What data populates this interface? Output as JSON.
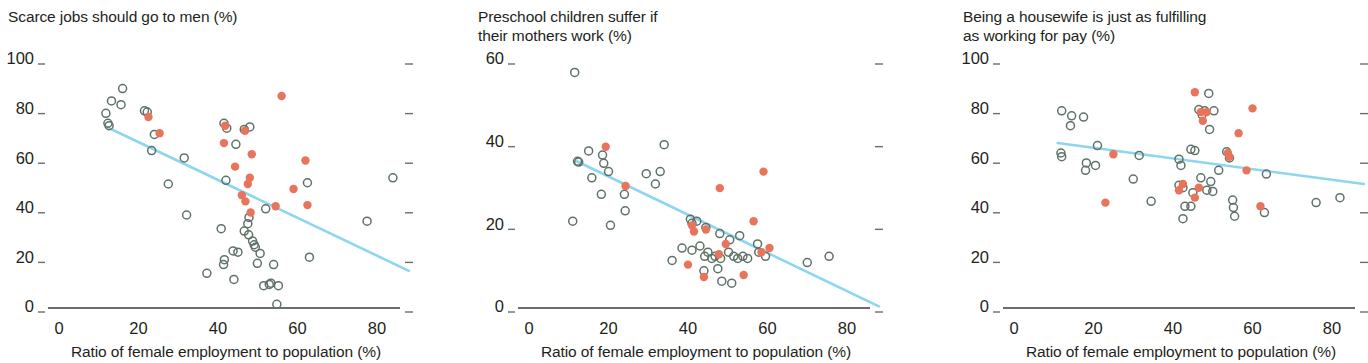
{
  "figure": {
    "width": 1368,
    "height": 363,
    "background": "#ffffff",
    "open_point_color": "#5f7268",
    "filled_point_color": "#e8745b",
    "trend_line_color": "#8ed5ef",
    "axis_color": "#3b3b3b",
    "text_color": "#231f20"
  },
  "chart_data": [
    {
      "type": "scatter",
      "panel_index": 0,
      "title": "Scarce jobs should go to men (%)",
      "title_lines": [
        "Scarce jobs should go to men (%)"
      ],
      "xlabel": "Ratio of female employment to population (%)",
      "ylabel": "Scarce jobs should go to men (%)",
      "xlim": [
        0,
        90
      ],
      "ylim": [
        0,
        100
      ],
      "xticks": [
        0,
        20,
        40,
        60,
        80
      ],
      "yticks": [
        0,
        20,
        40,
        60,
        80,
        100
      ],
      "xticklabels": [
        "0",
        "20",
        "40",
        "60",
        "80"
      ],
      "yticklabels": [
        "0",
        "20",
        "40",
        "60",
        "80",
        "100"
      ],
      "grid": false,
      "legend": "none",
      "right_ticks": true,
      "trend": {
        "x0": 12.0,
        "y0": 73.0,
        "x1": 88.0,
        "y1": 15.0
      },
      "series": [
        {
          "name": "open",
          "marker": "open-circle",
          "color": "#5f7268",
          "points": [
            [
              16.0,
              88.5
            ],
            [
              13.2,
              83.5
            ],
            [
              15.6,
              82.0
            ],
            [
              11.8,
              78.5
            ],
            [
              21.5,
              79.5
            ],
            [
              22.2,
              79.0
            ],
            [
              12.3,
              74.5
            ],
            [
              12.6,
              73.5
            ],
            [
              24.0,
              70.0
            ],
            [
              23.3,
              63.5
            ],
            [
              31.5,
              60.5
            ],
            [
              41.5,
              74.5
            ],
            [
              42.2,
              72.5
            ],
            [
              46.6,
              72.0
            ],
            [
              48.0,
              73.0
            ],
            [
              44.5,
              66.0
            ],
            [
              42.0,
              51.5
            ],
            [
              62.5,
              50.5
            ],
            [
              84.0,
              52.5
            ],
            [
              27.5,
              50.0
            ],
            [
              32.1,
              37.5
            ],
            [
              52.0,
              40.0
            ],
            [
              47.8,
              36.5
            ],
            [
              47.5,
              34.0
            ],
            [
              40.8,
              32.0
            ],
            [
              46.6,
              31.0
            ],
            [
              47.7,
              29.5
            ],
            [
              48.7,
              27.0
            ],
            [
              49.1,
              25.5
            ],
            [
              49.4,
              24.5
            ],
            [
              43.8,
              23.0
            ],
            [
              45.0,
              22.5
            ],
            [
              50.6,
              22.0
            ],
            [
              63.0,
              20.5
            ],
            [
              77.5,
              35.0
            ],
            [
              41.6,
              19.5
            ],
            [
              41.4,
              17.5
            ],
            [
              49.9,
              18.0
            ],
            [
              54.0,
              17.5
            ],
            [
              37.2,
              14.0
            ],
            [
              44.0,
              11.5
            ],
            [
              51.5,
              9.0
            ],
            [
              52.9,
              9.5
            ],
            [
              53.3,
              10.0
            ],
            [
              55.2,
              9.0
            ],
            [
              54.8,
              1.5
            ]
          ]
        },
        {
          "name": "filled",
          "marker": "filled-circle",
          "color": "#e8745b",
          "points": [
            [
              56.0,
              85.5
            ],
            [
              22.5,
              77.0
            ],
            [
              25.3,
              70.5
            ],
            [
              41.8,
              73.5
            ],
            [
              46.8,
              71.5
            ],
            [
              41.5,
              66.5
            ],
            [
              48.5,
              62.0
            ],
            [
              62.0,
              59.5
            ],
            [
              44.3,
              57.0
            ],
            [
              48.0,
              52.5
            ],
            [
              47.5,
              50.0
            ],
            [
              46.0,
              45.5
            ],
            [
              59.0,
              48.0
            ],
            [
              48.2,
              38.5
            ],
            [
              54.5,
              41.0
            ],
            [
              62.5,
              41.5
            ],
            [
              46.9,
              43.0
            ]
          ]
        }
      ]
    },
    {
      "type": "scatter",
      "panel_index": 1,
      "title": "Preschool children suffer if their mothers work (%)",
      "title_lines": [
        "Preschool children suffer if",
        "their mothers work (%)"
      ],
      "xlabel": "Ratio of female employment to population (%)",
      "ylabel": "Preschool children suffer if their mothers work (%)",
      "xlim": [
        0,
        90
      ],
      "ylim": [
        0,
        60
      ],
      "xticks": [
        0,
        20,
        40,
        60,
        80
      ],
      "yticks": [
        0,
        20,
        40,
        60
      ],
      "xticklabels": [
        "0",
        "20",
        "40",
        "60",
        "80"
      ],
      "yticklabels": [
        "0",
        "20",
        "40",
        "60"
      ],
      "grid": false,
      "legend": "none",
      "right_ticks": true,
      "trend": {
        "x0": 12.0,
        "y0": 35.5,
        "x1": 88.0,
        "y1": 0.4
      },
      "series": [
        {
          "name": "open",
          "marker": "open-circle",
          "color": "#5f7268",
          "points": [
            [
              11.5,
              57.0
            ],
            [
              15.0,
              38.0
            ],
            [
              18.5,
              37.0
            ],
            [
              18.8,
              35.0
            ],
            [
              12.2,
              35.5
            ],
            [
              12.5,
              35.3
            ],
            [
              20.0,
              33.0
            ],
            [
              15.8,
              31.5
            ],
            [
              18.2,
              27.5
            ],
            [
              24.0,
              27.5
            ],
            [
              24.2,
              23.5
            ],
            [
              11.0,
              21.0
            ],
            [
              20.5,
              20.0
            ],
            [
              34.0,
              39.5
            ],
            [
              29.5,
              32.5
            ],
            [
              31.8,
              30.0
            ],
            [
              33.0,
              33.0
            ],
            [
              40.6,
              21.5
            ],
            [
              42.2,
              21.0
            ],
            [
              41.0,
              20.5
            ],
            [
              44.5,
              19.5
            ],
            [
              48.0,
              18.0
            ],
            [
              50.5,
              16.5
            ],
            [
              53.0,
              17.5
            ],
            [
              57.5,
              15.5
            ],
            [
              57.8,
              13.5
            ],
            [
              38.5,
              14.5
            ],
            [
              41.0,
              14.0
            ],
            [
              43.0,
              15.0
            ],
            [
              45.0,
              13.5
            ],
            [
              44.2,
              12.5
            ],
            [
              46.0,
              12.0
            ],
            [
              46.8,
              12.5
            ],
            [
              48.2,
              12.0
            ],
            [
              50.2,
              13.5
            ],
            [
              51.5,
              12.5
            ],
            [
              52.5,
              12.0
            ],
            [
              53.8,
              12.5
            ],
            [
              55.0,
              12.0
            ],
            [
              36.0,
              11.5
            ],
            [
              44.0,
              9.0
            ],
            [
              47.5,
              9.5
            ],
            [
              48.5,
              6.5
            ],
            [
              51.0,
              6.0
            ],
            [
              59.5,
              12.5
            ],
            [
              70.0,
              11.0
            ],
            [
              75.5,
              12.5
            ]
          ]
        },
        {
          "name": "filled",
          "marker": "filled-circle",
          "color": "#e8745b",
          "points": [
            [
              19.3,
              39.0
            ],
            [
              24.3,
              29.5
            ],
            [
              48.0,
              29.0
            ],
            [
              59.0,
              33.0
            ],
            [
              41.0,
              20.0
            ],
            [
              41.5,
              18.5
            ],
            [
              44.5,
              19.0
            ],
            [
              56.5,
              21.0
            ],
            [
              49.5,
              15.5
            ],
            [
              47.8,
              13.0
            ],
            [
              58.5,
              13.5
            ],
            [
              60.5,
              14.5
            ],
            [
              40.0,
              10.5
            ],
            [
              44.0,
              7.5
            ],
            [
              54.0,
              8.0
            ]
          ]
        }
      ]
    },
    {
      "type": "scatter",
      "panel_index": 2,
      "title": "Being a housewife is just as fulfilling as working for pay (%)",
      "title_lines": [
        "Being a housewife is just as fulfilling",
        "as working for pay (%)"
      ],
      "xlabel": "Ratio of female employment to population (%)",
      "ylabel": "Being a housewife is just as fulfilling as working for pay (%)",
      "xlim": [
        0,
        90
      ],
      "ylim": [
        0,
        100
      ],
      "xticks": [
        0,
        20,
        40,
        60,
        80
      ],
      "yticks": [
        0,
        20,
        40,
        60,
        80,
        100
      ],
      "xticklabels": [
        "0",
        "20",
        "40",
        "60",
        "80"
      ],
      "yticklabels": [
        "0",
        "20",
        "40",
        "60",
        "80",
        "100"
      ],
      "grid": false,
      "legend": "none",
      "right_ticks": true,
      "trend": {
        "x0": 11.0,
        "y0": 66.5,
        "x1": 88.0,
        "y1": 50.0
      },
      "series": [
        {
          "name": "open",
          "marker": "open-circle",
          "color": "#5f7268",
          "points": [
            [
              49.0,
              86.5
            ],
            [
              46.5,
              80.0
            ],
            [
              48.0,
              79.5
            ],
            [
              50.3,
              79.5
            ],
            [
              47.3,
              78.0
            ],
            [
              12.0,
              79.5
            ],
            [
              14.5,
              77.5
            ],
            [
              17.5,
              77.0
            ],
            [
              14.2,
              73.5
            ],
            [
              49.2,
              72.0
            ],
            [
              11.8,
              62.5
            ],
            [
              12.0,
              61.0
            ],
            [
              21.0,
              65.5
            ],
            [
              31.5,
              61.5
            ],
            [
              41.5,
              60.0
            ],
            [
              42.0,
              57.5
            ],
            [
              44.5,
              64.0
            ],
            [
              45.5,
              63.5
            ],
            [
              53.5,
              63.0
            ],
            [
              54.2,
              60.5
            ],
            [
              51.5,
              55.5
            ],
            [
              18.2,
              58.5
            ],
            [
              18.0,
              55.5
            ],
            [
              20.5,
              57.5
            ],
            [
              30.0,
              52.0
            ],
            [
              47.0,
              52.5
            ],
            [
              49.5,
              51.0
            ],
            [
              63.5,
              54.0
            ],
            [
              41.5,
              49.5
            ],
            [
              42.5,
              48.5
            ],
            [
              48.5,
              47.5
            ],
            [
              50.0,
              47.0
            ],
            [
              34.5,
              43.0
            ],
            [
              43.0,
              41.0
            ],
            [
              44.5,
              41.0
            ],
            [
              55.0,
              43.5
            ],
            [
              55.2,
              40.5
            ],
            [
              63.0,
              38.5
            ],
            [
              55.5,
              37.0
            ],
            [
              42.5,
              36.0
            ],
            [
              45.0,
              46.5
            ],
            [
              76.0,
              42.5
            ],
            [
              82.0,
              44.5
            ]
          ]
        },
        {
          "name": "filled",
          "marker": "filled-circle",
          "color": "#e8745b",
          "points": [
            [
              45.5,
              87.0
            ],
            [
              60.0,
              80.5
            ],
            [
              47.0,
              79.0
            ],
            [
              48.5,
              79.0
            ],
            [
              47.5,
              75.5
            ],
            [
              56.5,
              70.5
            ],
            [
              25.0,
              62.0
            ],
            [
              53.8,
              62.5
            ],
            [
              54.2,
              61.0
            ],
            [
              58.5,
              55.5
            ],
            [
              42.5,
              50.0
            ],
            [
              41.5,
              47.5
            ],
            [
              46.5,
              48.5
            ],
            [
              45.5,
              44.5
            ],
            [
              23.0,
              42.5
            ],
            [
              62.0,
              41.0
            ]
          ]
        }
      ]
    }
  ]
}
